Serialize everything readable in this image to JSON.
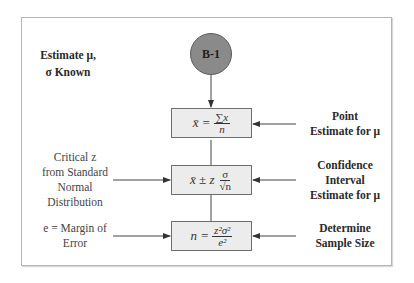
{
  "diagram": {
    "node": {
      "label": "B-1"
    },
    "title_label": {
      "line1": "Estimate μ,",
      "line2": "σ Known"
    },
    "boxes": [
      {
        "id": "point-estimate-formula",
        "lhs": "x̄ =",
        "numerator": "∑x",
        "denominator": "n"
      },
      {
        "id": "confidence-interval-formula",
        "lhs": "x̄ ± z",
        "numerator": "σ",
        "denominator": "√n"
      },
      {
        "id": "sample-size-formula",
        "lhs": "n =",
        "numerator": "z²σ²",
        "denominator": "e²"
      }
    ],
    "right_labels": [
      {
        "line1": "Point",
        "line2": "Estimate for μ"
      },
      {
        "line1": "Confidence",
        "line2": "Interval",
        "line3": "Estimate for μ"
      },
      {
        "line1": "Determine",
        "line2": "Sample Size"
      }
    ],
    "left_labels": [
      {
        "line1": "Critical z",
        "line2": "from Standard",
        "line3": "Normal",
        "line4": "Distribution"
      },
      {
        "line1": "e = Margin of",
        "line2": "Error"
      }
    ],
    "colors": {
      "node_fill": "#8a8a8a",
      "box_fill": "#ececec",
      "frame": "#b5b5b5",
      "line": "#444444"
    }
  }
}
